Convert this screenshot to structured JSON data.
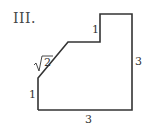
{
  "figure": {
    "label": "III.",
    "shape": "polygon",
    "side_labels": {
      "left": "1",
      "diagonal": "√2",
      "step": "1",
      "right": "3",
      "bottom": "3"
    },
    "stroke_color": "#333333"
  }
}
